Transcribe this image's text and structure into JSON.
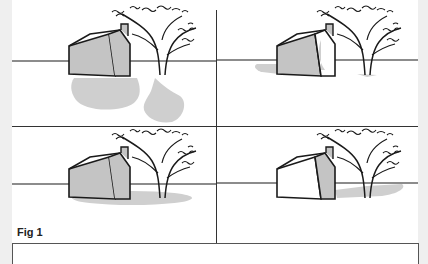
{
  "figure": {
    "label": "Fig 1",
    "panels": [
      {
        "id": "top-left",
        "description": "House and tree with long cast shadows (low sun)",
        "shadow": "long-forward"
      },
      {
        "id": "top-right",
        "description": "House and tree with short side shadow, lit front face",
        "shadow": "short-left"
      },
      {
        "id": "bottom-left",
        "description": "House and tree with shadow directly beneath (overhead sun)",
        "shadow": "under"
      },
      {
        "id": "bottom-right",
        "description": "House with lit left face, shadow to the right",
        "shadow": "short-right"
      }
    ]
  },
  "colors": {
    "page_bg": "#efefef",
    "panel_bg": "#ffffff",
    "house_fill": "#c4c4c4",
    "shadow": "#cfcfcf",
    "ink": "#1a1a1a"
  }
}
